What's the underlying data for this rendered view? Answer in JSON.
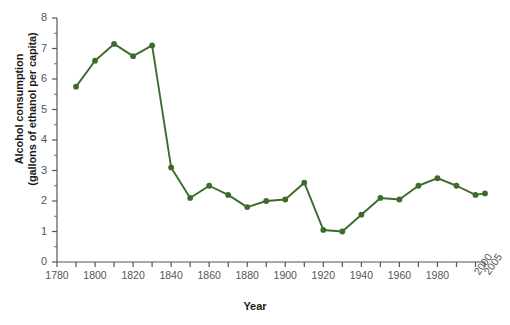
{
  "chart_data": {
    "type": "line",
    "title": "",
    "xlabel": "Year",
    "ylabel": "Alcohol consumption\n(gallons of ethanol per capita)",
    "xlim": [
      1780,
      2005
    ],
    "ylim": [
      0,
      8
    ],
    "grid": false,
    "legend": "none",
    "series_color": "#3d6b2c",
    "x": [
      1790,
      1800,
      1810,
      1820,
      1830,
      1840,
      1850,
      1860,
      1870,
      1880,
      1890,
      1900,
      1910,
      1920,
      1930,
      1940,
      1950,
      1960,
      1970,
      1980,
      1990,
      2000,
      2005
    ],
    "values": [
      5.75,
      6.6,
      7.15,
      6.75,
      7.1,
      3.1,
      2.1,
      2.5,
      2.2,
      1.8,
      2.0,
      2.05,
      2.6,
      1.05,
      1.0,
      1.55,
      2.1,
      2.05,
      2.5,
      2.75,
      2.5,
      2.2,
      2.25
    ],
    "ytick_labels": [
      "0",
      "1",
      "2",
      "3",
      "4",
      "5",
      "6",
      "7",
      "8"
    ],
    "ytick_values": [
      0,
      1,
      2,
      3,
      4,
      5,
      6,
      7,
      8
    ],
    "xtick_labels": [
      "1780",
      "1800",
      "1820",
      "1840",
      "1860",
      "1880",
      "1900",
      "1920",
      "1940",
      "1960",
      "1980",
      "2000",
      "2005"
    ],
    "xtick_values": [
      1780,
      1800,
      1820,
      1840,
      1860,
      1880,
      1900,
      1920,
      1940,
      1960,
      1980,
      2000,
      2005
    ],
    "xtick_minor_values": [
      1790,
      1810,
      1830,
      1850,
      1870,
      1890,
      1910,
      1930,
      1950,
      1970,
      1990
    ],
    "xtick_rotated": [
      "2000",
      "2005"
    ]
  },
  "axis": {
    "y_title": "Alcohol consumption\n(gallons of ethanol per capita)",
    "x_title": "Year"
  }
}
